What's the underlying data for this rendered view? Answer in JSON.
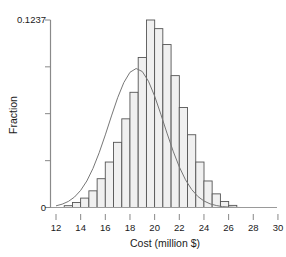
{
  "chart_data": {
    "type": "bar",
    "title": "",
    "subtitle": "",
    "xlabel": "Cost (million $)",
    "ylabel": "Fraction",
    "xlim": [
      12,
      30
    ],
    "ylim": [
      0,
      0.1237
    ],
    "grid": false,
    "legend": null,
    "x_ticks": [
      12,
      14,
      16,
      18,
      20,
      22,
      24,
      26,
      28,
      30
    ],
    "x_tick_labels": [
      "12",
      "14",
      "16",
      "18",
      "20",
      "22",
      "24",
      "26",
      "28",
      "30"
    ],
    "y_ticks": [
      0,
      0.1237
    ],
    "y_tick_labels": [
      "0",
      "0.1237"
    ],
    "y_minor_ticks": [
      0.0309,
      0.0619,
      0.0928
    ],
    "bin_width": 0.667,
    "bin_centers": [
      13.0,
      13.67,
      14.33,
      15.0,
      15.67,
      16.33,
      17.0,
      17.67,
      18.33,
      19.0,
      19.67,
      20.33,
      21.0,
      21.67,
      22.33,
      23.0,
      23.67,
      24.33,
      25.0,
      25.67,
      26.33
    ],
    "categories": [
      "13.0",
      "13.67",
      "14.33",
      "15.0",
      "15.67",
      "16.33",
      "17.0",
      "17.67",
      "18.33",
      "19.0",
      "19.67",
      "20.33",
      "21.0",
      "21.67",
      "22.33",
      "23.0",
      "23.67",
      "24.33",
      "25.0",
      "25.67",
      "26.33"
    ],
    "values": [
      0.0012,
      0.0033,
      0.0062,
      0.011,
      0.019,
      0.03,
      0.043,
      0.0585,
      0.076,
      0.099,
      0.1237,
      0.118,
      0.1075,
      0.087,
      0.066,
      0.048,
      0.03,
      0.0175,
      0.009,
      0.004,
      0.0014
    ],
    "series": [
      {
        "name": "Histogram",
        "values": [
          0.0012,
          0.0033,
          0.0062,
          0.011,
          0.019,
          0.03,
          0.043,
          0.0585,
          0.076,
          0.099,
          0.1237,
          0.118,
          0.1075,
          0.087,
          0.066,
          0.048,
          0.03,
          0.0175,
          0.009,
          0.004,
          0.0014
        ],
        "color": "#f0f0f0",
        "edge_color": "#555555"
      },
      {
        "name": "Fitted normal curve",
        "type": "line",
        "color": "#777777",
        "mean": 20.0,
        "sigma": 2.35,
        "peak": 0.121,
        "x": [
          12.0,
          12.5,
          13.0,
          13.5,
          14.0,
          14.5,
          15.0,
          15.5,
          16.0,
          16.5,
          17.0,
          17.5,
          18.0,
          18.5,
          19.0,
          19.5,
          20.0,
          20.5,
          21.0,
          21.5,
          22.0,
          22.5,
          23.0,
          23.5,
          24.0,
          24.5,
          25.0,
          25.5,
          26.0,
          26.5,
          27.0,
          27.5,
          28.0
        ],
        "y": [
          0.0011,
          0.0022,
          0.004,
          0.0069,
          0.0113,
          0.0175,
          0.0258,
          0.0361,
          0.0479,
          0.0604,
          0.0724,
          0.0824,
          0.0892,
          0.0917,
          0.0897,
          0.0833,
          0.0735,
          0.0616,
          0.0491,
          0.0372,
          0.0268,
          0.0183,
          0.0119,
          0.0073,
          0.0043,
          0.0024,
          0.0013,
          0.0006,
          0.0003,
          0.0001,
          0.0,
          0.0,
          0.0
        ]
      }
    ],
    "colors": {
      "bar_fill": "#f0f0f0",
      "bar_edge": "#555555",
      "curve": "#808080",
      "axis": "#888888",
      "text": "#1a1a1a"
    }
  },
  "axes": {
    "x_title": "Cost (million $)",
    "y_title": "Fraction",
    "y_max_label": "0.1237",
    "y_zero_label": "0"
  }
}
